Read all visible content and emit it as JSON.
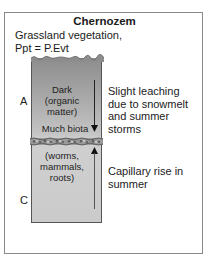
{
  "title": "Chernozem",
  "subtitle": {
    "line1": "Grassland vegetation,",
    "line2": "Ppt = P.Evt"
  },
  "horizons": {
    "upper": "A",
    "lower": "C"
  },
  "column_labels": {
    "dark_line1": "Dark",
    "dark_line2": "(organic",
    "dark_line3": "matter)",
    "biota": "Much biota",
    "fauna_line1": "(worms,",
    "fauna_line2": "mammals,",
    "fauna_line3": "roots)"
  },
  "processes": {
    "leaching_line1": "Slight leaching",
    "leaching_line2": "due to snowmelt",
    "leaching_line3": "and summer",
    "leaching_line4": "storms",
    "capillary_line1": "Capillary rise in",
    "capillary_line2": "summer"
  },
  "colors": {
    "upper_soil": "#8d8d8d",
    "lower_soil": "#cbcbcb",
    "frame": "#8a8a8a"
  }
}
